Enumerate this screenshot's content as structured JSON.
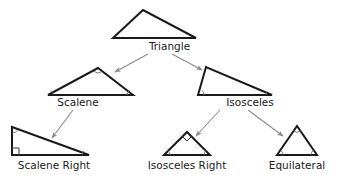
{
  "diagram": {
    "colors": {
      "shape_stroke": "#1a1a1a",
      "arrow": "#8a8a8a",
      "text": "#1a1a1a",
      "background": "#ffffff",
      "marker": "#6e6e6e"
    },
    "nodes": [
      {
        "id": "triangle",
        "label": "Triangle",
        "level": 1,
        "shape": "obtuse-scalene-triangle",
        "points": "113,38 143,10 196,38",
        "markers": []
      },
      {
        "id": "scalene",
        "label": "Scalene",
        "level": 2,
        "shape": "acute-scalene-triangle",
        "points": "48,95 98,68 133,95",
        "markers": [
          "angle-arc-left",
          "angle-arc-apex",
          "angle-arc-right"
        ]
      },
      {
        "id": "isosceles",
        "label": "Isosceles",
        "level": 2,
        "shape": "obtuse-isosceles-triangle",
        "points": "198,95 206,67 272,95",
        "markers": [
          "angle-arc-left",
          "angle-arc-right"
        ]
      },
      {
        "id": "scalene-right",
        "label": "Scalene Right",
        "level": 3,
        "shape": "right-scalene-triangle",
        "points": "12,155 12,127 89,155",
        "markers": [
          "right-angle-square",
          "angle-arc-top",
          "angle-arc-right"
        ]
      },
      {
        "id": "isosceles-right",
        "label": "Isosceles Right",
        "level": 3,
        "shape": "right-isosceles-triangle",
        "points": "164,155 187,132 210,155",
        "markers": [
          "right-angle-square-apex",
          "angle-arc-left",
          "angle-arc-right"
        ]
      },
      {
        "id": "equilateral",
        "label": "Equilateral",
        "level": 3,
        "shape": "equilateral-triangle",
        "points": "277,155 297,126 317,155",
        "markers": [
          "angle-arc-left",
          "angle-arc-right",
          "angle-arc-apex"
        ]
      }
    ],
    "edges": [
      {
        "id": "triangle-to-scalene",
        "from": "triangle",
        "to": "scalene",
        "x1": 148,
        "y1": 54,
        "x2": 115,
        "y2": 72
      },
      {
        "id": "triangle-to-isosceles",
        "from": "triangle",
        "to": "isosceles",
        "x1": 172,
        "y1": 54,
        "x2": 202,
        "y2": 70
      },
      {
        "id": "scalene-to-scalene-right",
        "from": "scalene",
        "to": "scalene-right",
        "x1": 73,
        "y1": 110,
        "x2": 52,
        "y2": 138
      },
      {
        "id": "isosceles-to-isosceles-right",
        "from": "isosceles",
        "to": "isosceles-right",
        "x1": 220,
        "y1": 110,
        "x2": 196,
        "y2": 136
      },
      {
        "id": "isosceles-to-equilateral",
        "from": "isosceles",
        "to": "equilateral",
        "x1": 248,
        "y1": 110,
        "x2": 283,
        "y2": 136
      }
    ]
  }
}
